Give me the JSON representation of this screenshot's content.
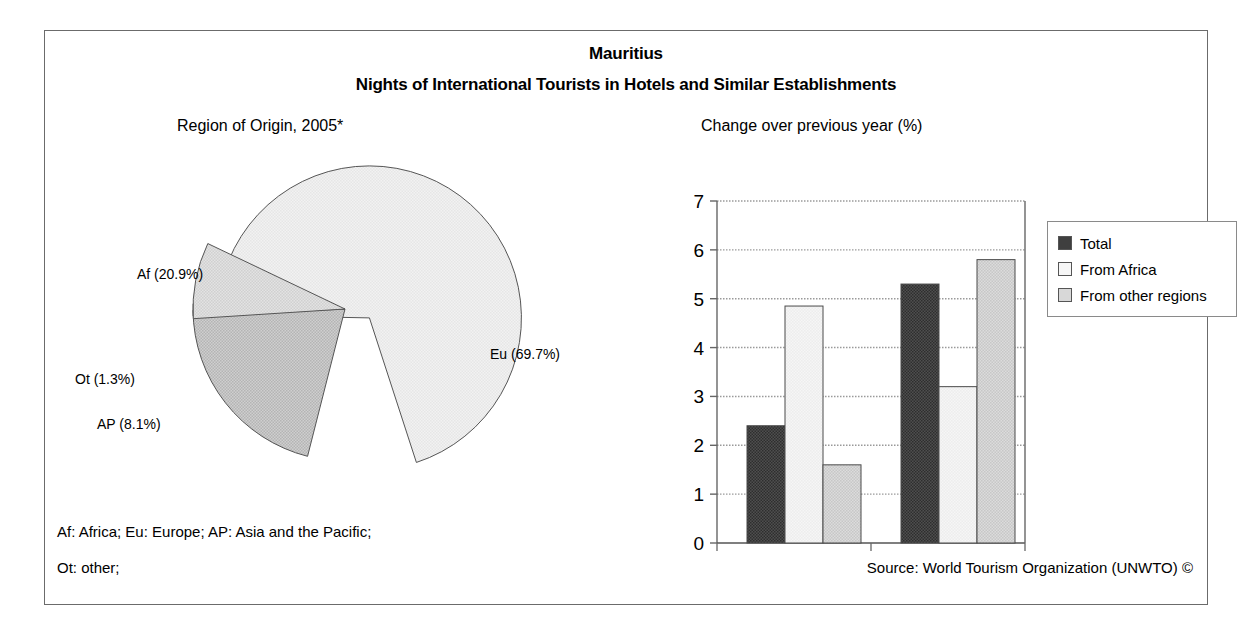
{
  "header": {
    "country": "Mauritius",
    "subject": "Nights of International Tourists in Hotels and Similar Establishments"
  },
  "pie_panel": {
    "subtitle": "Region of Origin, 2005*"
  },
  "bar_panel": {
    "subtitle": "Change over previous year (%)"
  },
  "legend": {
    "items": [
      {
        "label": "Total",
        "color": "#595959"
      },
      {
        "label": "From Africa",
        "color": "#f2f2f2"
      },
      {
        "label": "From other regions",
        "color": "#d4d4d4"
      }
    ]
  },
  "footnotes": {
    "line1": "Af: Africa; Eu: Europe; AP: Asia and the Pacific;",
    "line2": "Ot: other;",
    "source": "Source: World Tourism Organization (UNWTO) ©"
  },
  "chart_data": [
    {
      "type": "pie",
      "title": "Region of Origin, 2005*",
      "labels": [
        "Af (20.9%)",
        "Ot (1.3%)",
        "AP (8.1%)",
        "Eu (69.7%)"
      ],
      "categories": [
        "Af",
        "Ot",
        "AP",
        "Eu"
      ],
      "values": [
        20.9,
        1.3,
        8.1,
        69.7
      ],
      "colors": [
        "#c4c4c4",
        "#4a4a4a",
        "#dedede",
        "#efefef"
      ],
      "exploded": [
        "Eu"
      ],
      "legend_position": "none",
      "annotations": [
        "Af: Africa",
        "Eu: Europe",
        "AP: Asia and the Pacific",
        "Ot: other"
      ]
    },
    {
      "type": "bar",
      "title": "Change over previous year (%)",
      "xlabel": "",
      "ylabel": "",
      "ylim": [
        0,
        7
      ],
      "yticks": [
        0,
        1,
        2,
        3,
        4,
        5,
        6,
        7
      ],
      "grid": true,
      "legend_position": "right",
      "categories": [
        "2004/2003",
        "2005*/2004"
      ],
      "series": [
        {
          "name": "Total",
          "values": [
            2.4,
            5.3
          ],
          "color": "#595959"
        },
        {
          "name": "From Africa",
          "values": [
            4.85,
            3.2
          ],
          "color": "#f2f2f2"
        },
        {
          "name": "From other regions",
          "values": [
            1.6,
            5.8
          ],
          "color": "#d4d4d4"
        }
      ]
    }
  ]
}
